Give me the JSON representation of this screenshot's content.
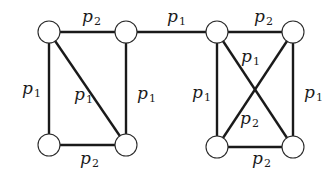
{
  "diagram": {
    "type": "graph",
    "nodes": [
      "a",
      "b",
      "c",
      "d",
      "e",
      "f",
      "g",
      "h"
    ],
    "edges": [
      {
        "from": "a",
        "to": "b",
        "label": {
          "base": "p",
          "sub": "2"
        }
      },
      {
        "from": "b",
        "to": "e",
        "label": {
          "base": "p",
          "sub": "1"
        }
      },
      {
        "from": "e",
        "to": "f",
        "label": {
          "base": "p",
          "sub": "2"
        }
      },
      {
        "from": "a",
        "to": "c",
        "label": {
          "base": "p",
          "sub": "1"
        }
      },
      {
        "from": "a",
        "to": "d",
        "label": {
          "base": "p",
          "sub": "1"
        }
      },
      {
        "from": "b",
        "to": "d",
        "label": {
          "base": "p",
          "sub": "1"
        }
      },
      {
        "from": "c",
        "to": "d",
        "label": {
          "base": "p",
          "sub": "2"
        }
      },
      {
        "from": "e",
        "to": "g",
        "label": {
          "base": "p",
          "sub": "1"
        }
      },
      {
        "from": "e",
        "to": "h",
        "label": {
          "base": "p",
          "sub": "1"
        }
      },
      {
        "from": "f",
        "to": "g",
        "label": {
          "base": "p",
          "sub": "2"
        }
      },
      {
        "from": "f",
        "to": "h",
        "label": {
          "base": "p",
          "sub": "1"
        }
      },
      {
        "from": "g",
        "to": "h",
        "label": {
          "base": "p",
          "sub": "2"
        }
      }
    ]
  }
}
